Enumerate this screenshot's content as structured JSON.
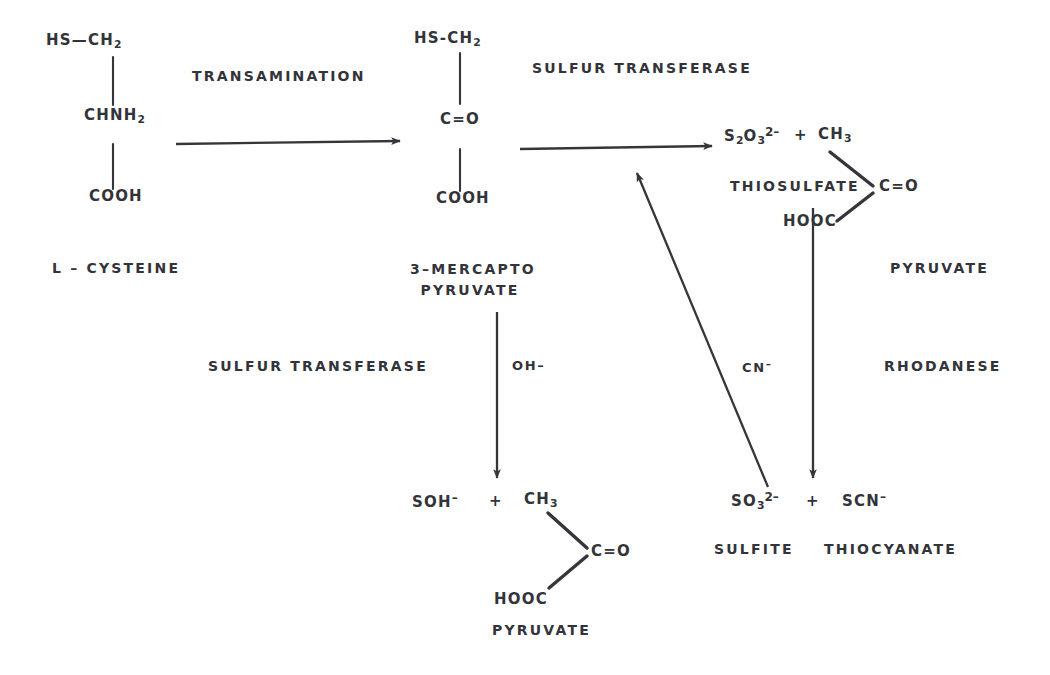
{
  "diagram": {
    "background": "#ffffff",
    "ink": "#33333a"
  },
  "structures": {
    "cysteine": {
      "top": "HS—CH",
      "top_sub": "2",
      "middle": "CHNH",
      "middle_sub": "2",
      "bottom": "COOH",
      "name": "L – CYSTEINE"
    },
    "mercaptopyruvate": {
      "top": "HS-CH",
      "top_sub": "2",
      "middle": "C=O",
      "bottom": "COOH",
      "name_line1": "3–MERCAPTO",
      "name_line2": "PYRUVATE"
    },
    "pyruvate_right": {
      "ch3": "CH",
      "ch3_sub": "3",
      "co": "C=O",
      "hooc": "HOOC",
      "name": "PYRUVATE"
    },
    "pyruvate_bottom": {
      "ch3": "CH",
      "ch3_sub": "3",
      "co": "C=O",
      "hooc": "HOOC",
      "name": "PYRUVATE"
    }
  },
  "species": {
    "thiosulfate": {
      "formula_s": "S",
      "formula_s_sub": "2",
      "formula_o": "O",
      "formula_o_sub": "3",
      "charge": "2–",
      "plus": "+",
      "name": "THIOSULFATE"
    },
    "sulfite": {
      "formula_s": "SO",
      "formula_sub": "3",
      "charge": "2–",
      "plus": "+",
      "name": "SULFITE"
    },
    "thiocyanate": {
      "formula": "SCN",
      "charge": "–",
      "name": "THIOCYANATE"
    },
    "sulfenate": {
      "formula": "SOH",
      "charge": "–",
      "plus": "+"
    }
  },
  "enzymes": {
    "transamination": "TRANSAMINATION",
    "sulfur_transferase_top": "SULFUR TRANSFERASE",
    "sulfur_transferase_left": "SULFUR TRANSFERASE",
    "rhodanese": "RHODANESE"
  },
  "cofactors": {
    "hydroxide": "OH–",
    "cyanide": "CN",
    "cyanide_charge": "–"
  },
  "arrows": [
    {
      "name": "transamination-arrow",
      "from": [
        175,
        144
      ],
      "to": [
        405,
        141
      ],
      "kind": "horizontal"
    },
    {
      "name": "sulfur-transferase-arrow",
      "from": [
        519,
        149
      ],
      "to": [
        716,
        146
      ],
      "kind": "horizontal"
    },
    {
      "name": "mercaptopyruvate-to-sulfenate-arrow",
      "from": [
        497,
        312
      ],
      "to": [
        497,
        482
      ],
      "kind": "vertical"
    },
    {
      "name": "thiosulfate-to-thiocyanate-arrow",
      "from": [
        813,
        208
      ],
      "to": [
        813,
        482
      ],
      "kind": "vertical"
    },
    {
      "name": "sulfite-to-pathway-arrow",
      "from": [
        768,
        487
      ],
      "to": [
        634,
        170
      ],
      "kind": "diagonal"
    }
  ],
  "bonds": [
    {
      "name": "cysteine-bond-upper",
      "x": 113,
      "y1": 56,
      "y2": 106
    },
    {
      "name": "cysteine-bond-lower",
      "x": 113,
      "y1": 143,
      "y2": 190
    },
    {
      "name": "mercaptopyruvate-bond-upper",
      "x": 460,
      "y1": 52,
      "y2": 104
    },
    {
      "name": "mercaptopyruvate-bond-lower",
      "x": 460,
      "y1": 148,
      "y2": 192
    },
    {
      "name": "pyruvate-right-bond-ch3",
      "x1": 828,
      "y1": 152,
      "x2": 872,
      "y2": 186
    },
    {
      "name": "pyruvate-right-bond-hooc",
      "x1": 872,
      "y1": 192,
      "x2": 836,
      "y2": 222
    },
    {
      "name": "pyruvate-bottom-bond-ch3",
      "x1": 547,
      "y1": 513,
      "x2": 586,
      "y2": 548
    },
    {
      "name": "pyruvate-bottom-bond-hooc",
      "x1": 586,
      "y1": 556,
      "x2": 548,
      "y2": 588
    }
  ]
}
